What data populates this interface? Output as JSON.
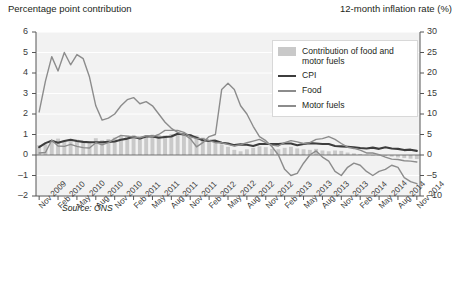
{
  "titles": {
    "left_axis": "Percentage point contribution",
    "right_axis": "12-month inflation rate (%)"
  },
  "source_note": "Source: ONS",
  "legend": {
    "items": [
      {
        "label": "Contribution of food and motor fuels",
        "key": "bar-swatch",
        "color": "#c9c9c9"
      },
      {
        "label": "CPI",
        "key": "line",
        "color": "#3d3d3d"
      },
      {
        "label": "Food",
        "key": "line",
        "color": "#8c8c8c"
      },
      {
        "label": "Motor fuels",
        "key": "line",
        "color": "#8c8c8c"
      }
    ]
  },
  "chart_data": {
    "type": "bar",
    "title": "",
    "subtitle": "",
    "xlabel": "",
    "ylabel": "Percentage point contribution",
    "y2label": "12-month inflation rate (%)",
    "ylim": [
      -2,
      6
    ],
    "y2lim": [
      -10,
      30
    ],
    "yticks": [
      -2,
      -1,
      0,
      1,
      2,
      3,
      4,
      5,
      6
    ],
    "y2ticks": [
      -10,
      -5,
      0,
      5,
      10,
      15,
      20,
      25,
      30
    ],
    "grid": true,
    "legend_position": "top-right",
    "categories": [
      "Nov 2009",
      "Dec 2009",
      "Jan 2010",
      "Feb 2010",
      "Mar 2010",
      "Apr 2010",
      "May 2010",
      "Jun 2010",
      "Jul 2010",
      "Aug 2010",
      "Sep 2010",
      "Oct 2010",
      "Nov 2010",
      "Dec 2010",
      "Jan 2011",
      "Feb 2011",
      "Mar 2011",
      "Apr 2011",
      "May 2011",
      "Jun 2011",
      "Jul 2011",
      "Aug 2011",
      "Sep 2011",
      "Oct 2011",
      "Nov 2011",
      "Dec 2011",
      "Jan 2012",
      "Feb 2012",
      "Mar 2012",
      "Apr 2012",
      "May 2012",
      "Jun 2012",
      "Jul 2012",
      "Aug 2012",
      "Sep 2012",
      "Oct 2012",
      "Nov 2012",
      "Dec 2012",
      "Jan 2013",
      "Feb 2013",
      "Mar 2013",
      "Apr 2013",
      "May 2013",
      "Jun 2013",
      "Jul 2013",
      "Aug 2013",
      "Sep 2013",
      "Oct 2013",
      "Nov 2013",
      "Dec 2013",
      "Jan 2014",
      "Feb 2014",
      "Mar 2014",
      "Apr 2014",
      "May 2014",
      "Jun 2014",
      "Jul 2014",
      "Aug 2014",
      "Sep 2014",
      "Oct 2014",
      "Nov 2014"
    ],
    "xtick_labels": [
      "Nov 2009",
      "Feb 2010",
      "May 2010",
      "Aug 2010",
      "Nov 2010",
      "Feb 2011",
      "May 2011",
      "Aug 2011",
      "Nov 2011",
      "Feb 2012",
      "May 2012",
      "Aug 2012",
      "Nov 2012",
      "Feb 2013",
      "May 2013",
      "Aug 2013",
      "Nov 2013",
      "Feb 2014",
      "May 2014",
      "Aug 2014",
      "Nov 2014"
    ],
    "xtick_indices": [
      0,
      3,
      6,
      9,
      12,
      15,
      18,
      21,
      24,
      27,
      30,
      33,
      36,
      39,
      42,
      45,
      48,
      51,
      54,
      57,
      60
    ],
    "series": [
      {
        "name": "Contribution of food and motor fuels",
        "type": "bar",
        "axis": "left",
        "unit": "percentage points",
        "color": "#c9c9c9",
        "values": [
          0.48,
          0.52,
          0.7,
          0.8,
          0.72,
          0.78,
          0.75,
          0.68,
          0.66,
          0.82,
          0.72,
          0.78,
          0.85,
          0.92,
          0.95,
          0.98,
          0.92,
          0.95,
          1.0,
          0.98,
          0.95,
          1.02,
          1.05,
          1.08,
          1.02,
          0.95,
          0.85,
          0.75,
          0.62,
          0.52,
          0.4,
          0.25,
          0.18,
          0.28,
          0.35,
          0.42,
          0.38,
          0.3,
          0.28,
          0.35,
          0.4,
          0.32,
          0.28,
          0.25,
          0.3,
          0.22,
          0.18,
          0.22,
          0.2,
          0.12,
          0.08,
          0.05,
          0.02,
          0.0,
          -0.02,
          -0.05,
          -0.08,
          -0.12,
          -0.15,
          -0.18,
          -0.2
        ]
      },
      {
        "name": "CPI",
        "type": "line",
        "axis": "right",
        "unit": "%",
        "color": "#3d3d3d",
        "values": [
          1.9,
          2.9,
          3.5,
          3.0,
          3.4,
          3.7,
          3.4,
          3.2,
          3.1,
          3.1,
          3.1,
          3.2,
          3.3,
          3.7,
          4.0,
          4.4,
          4.0,
          4.5,
          4.5,
          4.2,
          4.4,
          4.5,
          5.2,
          5.0,
          4.8,
          4.2,
          3.6,
          3.4,
          3.5,
          3.0,
          2.8,
          2.4,
          2.6,
          2.5,
          2.2,
          2.7,
          2.7,
          2.7,
          2.7,
          2.8,
          2.8,
          2.4,
          2.7,
          2.9,
          2.8,
          2.7,
          2.7,
          2.2,
          2.1,
          2.0,
          1.9,
          1.7,
          1.6,
          1.8,
          1.5,
          1.9,
          1.6,
          1.5,
          1.2,
          1.3,
          1.0
        ]
      },
      {
        "name": "Food",
        "type": "line",
        "axis": "right",
        "unit": "%",
        "color": "#8c8c8c",
        "values": [
          0.5,
          0.6,
          3.6,
          2.2,
          2.1,
          2.6,
          2.1,
          1.8,
          1.7,
          3.0,
          2.5,
          3.0,
          4.0,
          4.8,
          4.6,
          4.4,
          4.2,
          4.7,
          4.5,
          5.0,
          6.0,
          6.0,
          6.0,
          5.5,
          4.5,
          4.0,
          4.0,
          3.5,
          3.0,
          3.0,
          2.6,
          2.2,
          2.5,
          3.0,
          3.4,
          3.8,
          3.0,
          2.4,
          2.2,
          3.0,
          3.5,
          3.2,
          2.8,
          3.0,
          3.8,
          4.0,
          4.5,
          3.8,
          2.8,
          1.9,
          1.6,
          1.2,
          0.5,
          0.5,
          0.1,
          -0.5,
          -1.0,
          -1.1,
          -1.4,
          -1.5,
          -1.7
        ]
      },
      {
        "name": "Motor fuels",
        "type": "line",
        "axis": "right",
        "unit": "%",
        "color": "#8c8c8c",
        "values": [
          10.5,
          18.0,
          24.0,
          20.5,
          25.0,
          22.0,
          24.5,
          23.5,
          19.0,
          12.0,
          8.5,
          9.0,
          10.0,
          12.0,
          13.5,
          14.0,
          12.5,
          13.0,
          12.0,
          10.0,
          8.0,
          6.5,
          5.5,
          5.0,
          4.0,
          2.0,
          3.0,
          4.5,
          5.0,
          16.0,
          17.5,
          16.0,
          12.0,
          10.0,
          7.0,
          4.5,
          3.5,
          2.0,
          0.0,
          -3.5,
          -5.0,
          -4.5,
          -2.0,
          0.0,
          1.0,
          -0.5,
          -1.5,
          -4.0,
          -5.0,
          -3.0,
          -2.0,
          -2.5,
          -4.0,
          -5.0,
          -4.0,
          -3.5,
          -2.5,
          -3.0,
          -5.5,
          -6.5,
          -7.0
        ]
      }
    ]
  }
}
